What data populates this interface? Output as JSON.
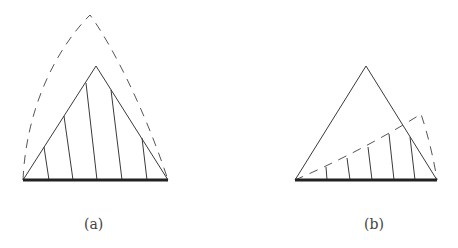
{
  "figures": [
    {
      "id": "a",
      "caption": "(a)",
      "description": "Triangle with vertical hatching inside; dashed curved envelope above apex"
    },
    {
      "id": "b",
      "caption": "(b)",
      "description": "Triangle with hatching below a dashed curve rising from left base to right"
    }
  ],
  "colors": {
    "line": "#3a3a3a",
    "dash": "#555555",
    "base": "#222222",
    "background": "#ffffff"
  }
}
